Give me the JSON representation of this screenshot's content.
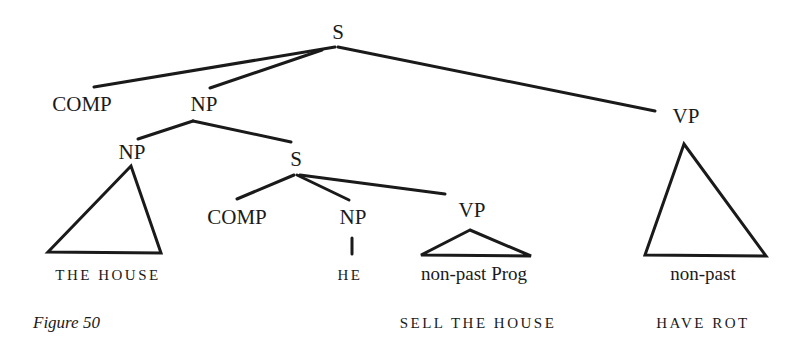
{
  "figure": {
    "caption": "Figure 50"
  },
  "tree": {
    "root": "S",
    "nodes": {
      "s_root": "S",
      "comp_top": "COMP",
      "np_top": "NP",
      "vp_top": "VP",
      "np_inner": "NP",
      "s_inner": "S",
      "comp_inner": "COMP",
      "np_he": "NP",
      "vp_inner": "VP"
    },
    "leaves": {
      "the_house": "THE HOUSE",
      "he": "HE",
      "non_past_prog": "non-past Prog",
      "sell_the_house": "SELL THE HOUSE",
      "non_past": "non-past",
      "have_rot": "HAVE ROT"
    }
  },
  "style": {
    "line_color": "#1a1a1a",
    "background": "#ffffff"
  }
}
